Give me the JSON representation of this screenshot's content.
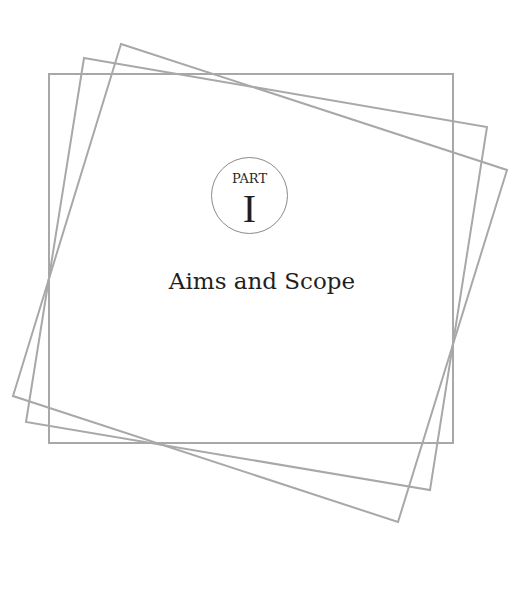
{
  "page": {
    "part_label": "PART",
    "part_numeral": "I",
    "title": "Aims and Scope"
  },
  "colors": {
    "frame_stroke": "#a8a8a8",
    "badge_stroke": "#8a8a8a",
    "text": "#1f1f1f",
    "background": "#ffffff"
  },
  "frames": [
    {
      "name": "upright-frame",
      "points": "49,74 453,74 453,443 49,443"
    },
    {
      "name": "rotated-frame-1",
      "points": "84,58 487,127 430,490 26,422"
    },
    {
      "name": "rotated-frame-2",
      "points": "121,44 507,170 398,522 13,396"
    }
  ]
}
